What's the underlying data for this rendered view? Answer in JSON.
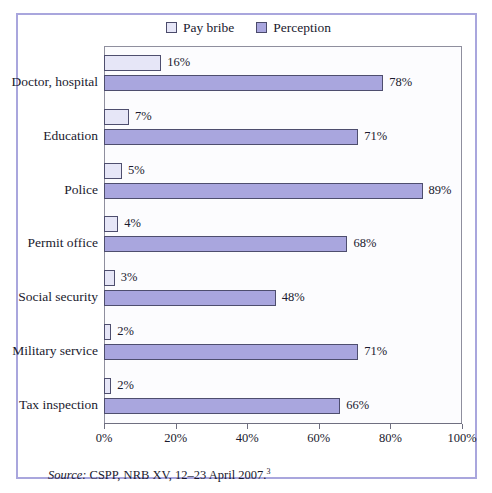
{
  "legend": {
    "entries": [
      {
        "label": "Pay bribe",
        "color": "#e6e6f7",
        "swatch": "pay"
      },
      {
        "label": "Perception",
        "color": "#a9a6de",
        "swatch": "perc"
      }
    ]
  },
  "source": {
    "lead": "Source:",
    "text": " CSPP, NRB XV, 12–23 April 2007.",
    "footnote": "3"
  },
  "chart_data": {
    "type": "bar",
    "orientation": "horizontal",
    "title": "",
    "xlabel": "",
    "ylabel": "",
    "xlim": [
      0,
      100
    ],
    "grid": false,
    "legend_position": "top-center",
    "tick_labels": [
      "0%",
      "20%",
      "40%",
      "60%",
      "80%",
      "100%"
    ],
    "ticks": [
      0,
      20,
      40,
      60,
      80,
      100
    ],
    "categories": [
      "Doctor, hospital",
      "Education",
      "Police",
      "Permit office",
      "Social security",
      "Military service",
      "Tax inspection"
    ],
    "series": [
      {
        "name": "Pay bribe",
        "color": "#e6e6f7",
        "values": [
          16,
          7,
          5,
          4,
          3,
          2,
          2
        ],
        "labels": [
          "16%",
          "7%",
          "5%",
          "4%",
          "3%",
          "2%",
          "2%"
        ]
      },
      {
        "name": "Perception",
        "color": "#a9a6de",
        "values": [
          78,
          71,
          89,
          68,
          48,
          71,
          66
        ],
        "labels": [
          "78%",
          "71%",
          "89%",
          "68%",
          "48%",
          "71%",
          "66%"
        ]
      }
    ]
  }
}
